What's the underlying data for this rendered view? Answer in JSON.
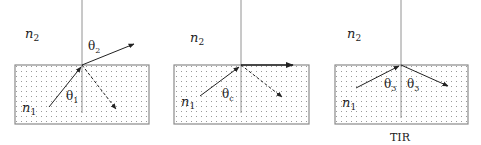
{
  "diagram": {
    "title": "",
    "panels": [
      {
        "id": "refraction",
        "outer_medium_label": "n",
        "outer_medium_sub": "2",
        "inner_medium_label": "n",
        "inner_medium_sub": "1",
        "incident_angle_label": "θ",
        "incident_angle_sub": "1",
        "refracted_angle_label": "θ",
        "refracted_angle_sub": "2",
        "caption": ""
      },
      {
        "id": "critical-angle",
        "outer_medium_label": "n",
        "outer_medium_sub": "2",
        "inner_medium_label": "n",
        "inner_medium_sub": "1",
        "incident_angle_label": "θ",
        "incident_angle_sub": "c",
        "caption": ""
      },
      {
        "id": "total-internal-reflection",
        "outer_medium_label": "n",
        "outer_medium_sub": "2",
        "inner_medium_label": "n",
        "inner_medium_sub": "1",
        "incident_angle_label": "θ",
        "incident_angle_sub": "3",
        "reflected_angle_label": "θ",
        "reflected_angle_sub": "3",
        "caption": "TIR"
      }
    ],
    "colors": {
      "line": "#222222",
      "normal": "#777777",
      "box_border": "#8a8a8a",
      "stipple": "#9a9a9a"
    }
  }
}
